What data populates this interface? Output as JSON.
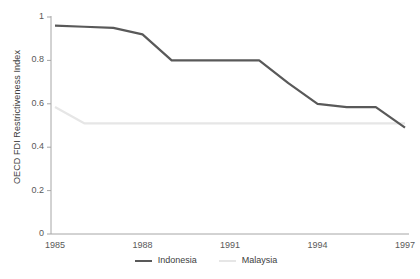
{
  "chart_data": {
    "type": "line",
    "title": "",
    "xlabel": "",
    "ylabel": "OECD FDI Restrictiveness Index",
    "xlim": [
      1985,
      1997
    ],
    "ylim": [
      0,
      1
    ],
    "grid": false,
    "legend_position": "bottom-center",
    "x": [
      1985,
      1986,
      1987,
      1988,
      1989,
      1990,
      1991,
      1992,
      1993,
      1994,
      1995,
      1996,
      1997
    ],
    "xticks": [
      "1985",
      "1988",
      "1991",
      "1994",
      "1997"
    ],
    "xtick_values": [
      1985,
      1988,
      1991,
      1994,
      1997
    ],
    "yticks": [
      "0",
      "0.2",
      "0.4",
      "0.6",
      "0.8",
      "1"
    ],
    "ytick_values": [
      0,
      0.2,
      0.4,
      0.6,
      0.8,
      1
    ],
    "series": [
      {
        "name": "Indonesia",
        "color": "#595959",
        "width": 2.2,
        "values": [
          0.96,
          0.955,
          0.95,
          0.92,
          0.8,
          0.8,
          0.8,
          0.8,
          0.695,
          0.6,
          0.585,
          0.585,
          0.49
        ]
      },
      {
        "name": "Malaysia",
        "color": "#e6e6e6",
        "width": 2.2,
        "values": [
          0.585,
          0.51,
          0.51,
          0.51,
          0.51,
          0.51,
          0.51,
          0.51,
          0.51,
          0.51,
          0.51,
          0.51,
          0.51
        ]
      }
    ]
  },
  "legend": {
    "items": [
      {
        "label": "Indonesia",
        "color": "#595959"
      },
      {
        "label": "Malaysia",
        "color": "#e6e6e6"
      }
    ]
  },
  "axes": {
    "axis_color": "#a6a6a6",
    "tick_color": "#a6a6a6",
    "text_color": "#595959"
  }
}
